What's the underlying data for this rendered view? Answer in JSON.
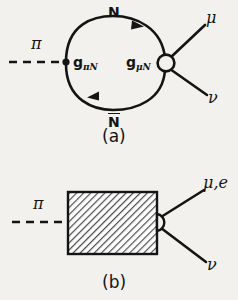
{
  "figure": {
    "background_color": "#f2f1ee",
    "ink_color": "#141414",
    "type": "feynman-diagram-pair"
  },
  "diagram_a": {
    "caption": "(a)",
    "incoming": {
      "label": "π",
      "line_style": "dashed",
      "name": "pion"
    },
    "loop": {
      "top_label": "N",
      "bottom_label": "N",
      "bottom_label_has_overline": true,
      "top_arrow_direction": "right",
      "bottom_arrow_direction": "left"
    },
    "vertex_left": {
      "label_base": "g",
      "label_sub": "πN",
      "style": "filled-dot"
    },
    "vertex_right": {
      "label_base": "g",
      "label_sub": "μN",
      "style": "open-circle"
    },
    "outgoing": [
      {
        "label": "μ",
        "name": "muon"
      },
      {
        "label": "ν",
        "name": "neutrino"
      }
    ]
  },
  "diagram_b": {
    "caption": "(b)",
    "incoming": {
      "label": "π",
      "line_style": "dashed",
      "name": "pion"
    },
    "blob": {
      "shape": "rectangle",
      "fill": "diagonal-hatch",
      "hatch_direction": "backslash"
    },
    "vertex_right": {
      "style": "open-circle"
    },
    "outgoing": [
      {
        "label": "μ,e",
        "name": "lepton"
      },
      {
        "label": "ν",
        "name": "neutrino"
      }
    ]
  }
}
